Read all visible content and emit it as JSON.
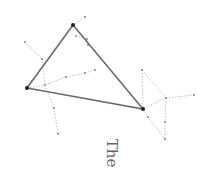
{
  "diagram": {
    "label": "The",
    "colors": {
      "edge": "#6a6a6a",
      "vertex": "#222222",
      "aux": "#b0b0b0",
      "aux_node": "#888888"
    },
    "triangle": [
      [
        73,
        25
      ],
      [
        27,
        88
      ],
      [
        143,
        109
      ]
    ],
    "aux_edges": [
      [
        [
          25,
          42
        ],
        [
          42,
          59
        ]
      ],
      [
        [
          42,
          59
        ],
        [
          45,
          85
        ]
      ],
      [
        [
          45,
          85
        ],
        [
          54,
          108
        ]
      ],
      [
        [
          54,
          108
        ],
        [
          58,
          134
        ]
      ],
      [
        [
          27,
          88
        ],
        [
          45,
          85
        ]
      ],
      [
        [
          45,
          85
        ],
        [
          66,
          77
        ]
      ],
      [
        [
          66,
          77
        ],
        [
          85,
          73
        ]
      ],
      [
        [
          85,
          73
        ],
        [
          95,
          70
        ]
      ],
      [
        [
          73,
          25
        ],
        [
          85,
          17
        ]
      ],
      [
        [
          76,
          36
        ],
        [
          87,
          39
        ]
      ],
      [
        [
          87,
          39
        ],
        [
          88,
          45
        ]
      ],
      [
        [
          142,
          70
        ],
        [
          143,
          109
        ]
      ],
      [
        [
          142,
          70
        ],
        [
          166,
          98
        ]
      ],
      [
        [
          166,
          98
        ],
        [
          194,
          95
        ]
      ],
      [
        [
          143,
          109
        ],
        [
          166,
          98
        ]
      ],
      [
        [
          166,
          98
        ],
        [
          165,
          122
        ]
      ],
      [
        [
          165,
          122
        ],
        [
          165,
          139
        ]
      ],
      [
        [
          143,
          109
        ],
        [
          148,
          117
        ]
      ],
      [
        [
          148,
          117
        ],
        [
          165,
          139
        ]
      ]
    ],
    "aux_nodes": [
      [
        25,
        42
      ],
      [
        42,
        59
      ],
      [
        45,
        85
      ],
      [
        54,
        108
      ],
      [
        58,
        134
      ],
      [
        66,
        77
      ],
      [
        85,
        73
      ],
      [
        95,
        70
      ],
      [
        85,
        17
      ],
      [
        76,
        36
      ],
      [
        87,
        39
      ],
      [
        88,
        45
      ],
      [
        142,
        70
      ],
      [
        166,
        98
      ],
      [
        194,
        95
      ],
      [
        165,
        122
      ],
      [
        148,
        117
      ],
      [
        165,
        139
      ]
    ]
  }
}
